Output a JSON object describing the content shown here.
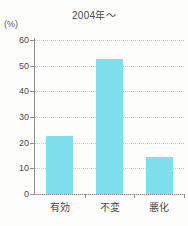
{
  "chart_data": {
    "type": "bar",
    "title": "2004年〜",
    "xlabel": "",
    "ylabel": "(%)",
    "categories": [
      "有効",
      "不変",
      "悪化"
    ],
    "values": [
      22.7,
      52.6,
      14.4
    ],
    "ylim": [
      0,
      60
    ],
    "yticks": [
      0,
      10,
      20,
      30,
      40,
      50,
      60
    ],
    "ytick_labels": [
      "0",
      "10",
      "20",
      "30",
      "40",
      "50",
      "60"
    ],
    "grid": "horizontal-dotted",
    "legend": null,
    "bar_color": "#7fdfec",
    "grid_color": "#e3bcbc",
    "axis_color": "#8d8d8d",
    "background": "#fdfdfb"
  }
}
